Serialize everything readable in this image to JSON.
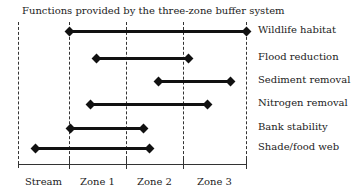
{
  "diagram": {
    "title": "Functions provided by the three-zone buffer system",
    "zones": [
      "Stream",
      "Zone 1",
      "Zone 2",
      "Zone 3"
    ],
    "boundaries_px": [
      18,
      69,
      126,
      183,
      246
    ],
    "functions": [
      {
        "label": "Wildlife habitat",
        "start": 69,
        "end": 246,
        "y": 31
      },
      {
        "label": "Flood reduction",
        "start": 96,
        "end": 188,
        "y": 58
      },
      {
        "label": "Sediment removal",
        "start": 158,
        "end": 230,
        "y": 81
      },
      {
        "label": "Nitrogen removal",
        "start": 90,
        "end": 207,
        "y": 104
      },
      {
        "label": "Bank stability",
        "start": 70,
        "end": 143,
        "y": 128
      },
      {
        "label": "Shade/food web",
        "start": 35,
        "end": 149,
        "y": 148
      }
    ]
  }
}
